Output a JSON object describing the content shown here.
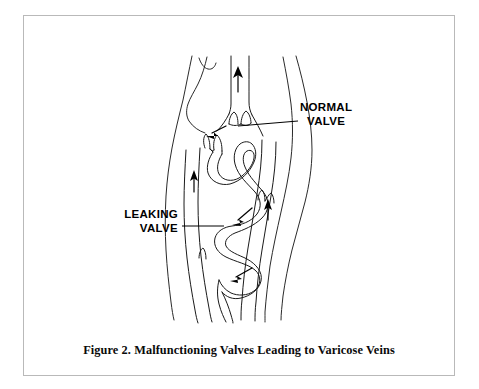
{
  "figure": {
    "caption": "Figure 2.  Malfunctioning Valves Leading to Varicose Veins",
    "frame_color": "#b9b9b9",
    "background": "#ffffff",
    "ink_color": "#1a1a1a"
  },
  "annotations": {
    "normal_valve": {
      "line1": "NORMAL",
      "line2": "VALVE",
      "leader_from_x": 300,
      "leader_to_x": 238,
      "leader_y": 124
    },
    "leaking_valve": {
      "line1": "LEAKING",
      "line2": "VALVE",
      "leader_from_x": 182,
      "leader_to_x": 224,
      "leader_y": 226
    }
  },
  "diagram_data": {
    "type": "anatomical-line-drawing",
    "subject": "Human leg showing veins with normal and malfunctioning (leaking) valves",
    "elements": [
      {
        "name": "leg-outline-left",
        "kind": "contour"
      },
      {
        "name": "leg-outline-right",
        "kind": "contour"
      },
      {
        "name": "knee-crease",
        "kind": "contour"
      },
      {
        "name": "deep-vein-center",
        "kind": "vein",
        "flow": "upward"
      },
      {
        "name": "deep-vein-left",
        "kind": "vein",
        "flow": "upward"
      },
      {
        "name": "deep-vein-right",
        "kind": "vein",
        "flow": "upward"
      },
      {
        "name": "varicose-vein",
        "kind": "vein",
        "flow": "downward-backflow",
        "shape": "tortuous"
      },
      {
        "name": "normal-valve-cusps",
        "kind": "valve",
        "state": "competent"
      },
      {
        "name": "leaking-valve-cusps",
        "kind": "valve",
        "state": "incompetent"
      }
    ],
    "flow_arrows": [
      {
        "name": "up-arrow-center-vein",
        "direction": "up",
        "x": 237,
        "y": 78
      },
      {
        "name": "up-arrow-left-vein",
        "direction": "up",
        "x": 196,
        "y": 180
      },
      {
        "name": "up-arrow-right-vein",
        "direction": "up",
        "x": 269,
        "y": 208
      },
      {
        "name": "backflow-arrow-upper",
        "direction": "down-left",
        "x": 214,
        "y": 133
      },
      {
        "name": "backflow-arrow-middle",
        "direction": "down-left",
        "x": 236,
        "y": 222
      },
      {
        "name": "backflow-arrow-lower",
        "direction": "down-left",
        "x": 232,
        "y": 277
      }
    ]
  }
}
